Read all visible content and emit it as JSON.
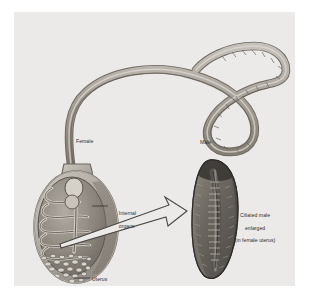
{
  "figure": {
    "background_color": "#ffffff",
    "plate_color": "#efeeec",
    "ink_color": "#2b2b2b",
    "worm_body_color": "#b9b4ad",
    "worm_shade_color": "#8b857d",
    "male_body_color": "#6f6a64",
    "labels": {
      "female": "Female",
      "male": "Male",
      "internal_organs_line1": "Internal",
      "internal_organs_line2": "organs",
      "uterus": "Uterus",
      "ciliated_line1": "Ciliated male",
      "ciliated_line2": "enlarged",
      "ciliated_line3": "(in female uterus)"
    }
  }
}
